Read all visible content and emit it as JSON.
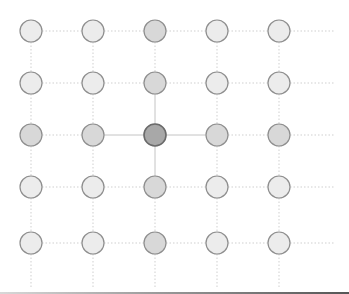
{
  "diagram": {
    "type": "grid-lattice",
    "columns_x": [
      31,
      93,
      155,
      217,
      279
    ],
    "rows_y": [
      31,
      83,
      135,
      187,
      243
    ],
    "radius": 11,
    "extend_right_to": 335,
    "extend_bottom_to": 288,
    "center": [
      2,
      2
    ],
    "colors": {
      "far_fill": "#ececec",
      "near_fill": "#d8d8d8",
      "center_fill": "#a8a8a8",
      "stroke": "#8e8e8e",
      "center_stroke": "#6a6a6a",
      "dotted_line": "#cfcfcf",
      "solid_line": "#c4c4c4"
    },
    "node_shades": [
      [
        "far",
        "far",
        "near",
        "far",
        "far"
      ],
      [
        "far",
        "far",
        "near",
        "far",
        "far"
      ],
      [
        "near",
        "near",
        "center",
        "near",
        "near"
      ],
      [
        "far",
        "far",
        "near",
        "far",
        "far"
      ],
      [
        "far",
        "far",
        "near",
        "far",
        "far"
      ]
    ]
  }
}
